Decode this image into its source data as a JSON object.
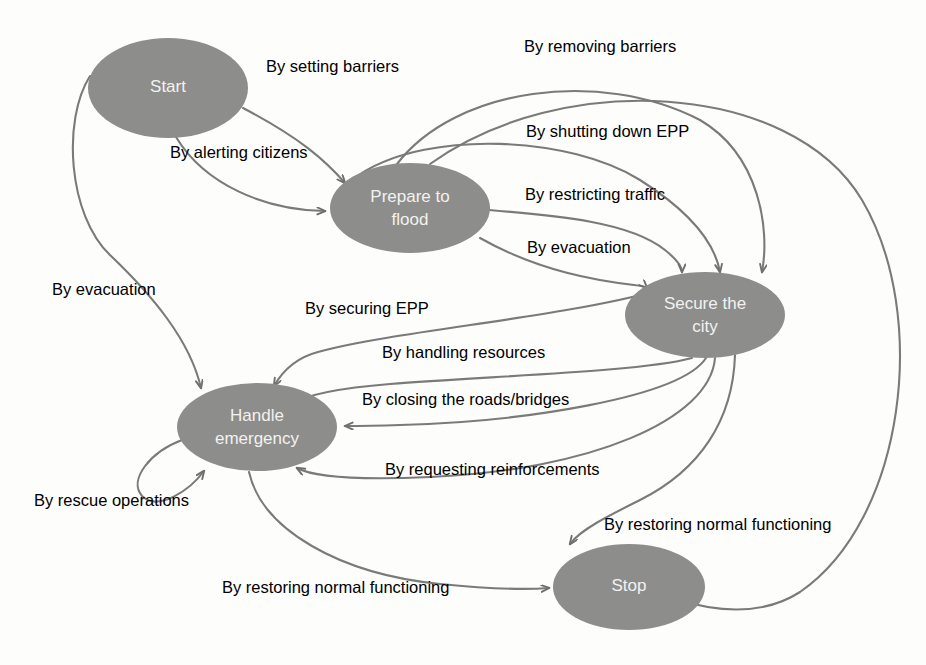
{
  "diagram": {
    "type": "state-machine",
    "colors": {
      "node_fill": "#8d8d8b",
      "node_text": "#f2f2f0",
      "edge_stroke": "#7a7a78",
      "label_text": "#2b2b2b",
      "background": "#fdfdfc"
    },
    "nodes": [
      {
        "id": "start",
        "label": "Start",
        "label_line1": "Start",
        "label_line2": "",
        "cx": 168,
        "cy": 88,
        "rx": 80,
        "ry": 50
      },
      {
        "id": "prepare",
        "label": "Prepare to flood",
        "label_line1": "Prepare to",
        "label_line2": "flood",
        "cx": 410,
        "cy": 208,
        "rx": 80,
        "ry": 45
      },
      {
        "id": "secure",
        "label": "Secure the city",
        "label_line1": "Secure the",
        "label_line2": "city",
        "cx": 705,
        "cy": 315,
        "rx": 80,
        "ry": 43
      },
      {
        "id": "handle",
        "label": "Handle emergency",
        "label_line1": "Handle",
        "label_line2": "emergency",
        "cx": 257,
        "cy": 427,
        "rx": 80,
        "ry": 44
      },
      {
        "id": "stop",
        "label": "Stop",
        "label_line1": "Stop",
        "label_line2": "",
        "cx": 629,
        "cy": 587,
        "rx": 76,
        "ry": 43
      }
    ],
    "edges": [
      {
        "id": "e1",
        "from": "start",
        "to": "prepare",
        "label": "By setting barriers",
        "label_x": 266,
        "label_y": 57
      },
      {
        "id": "e2",
        "from": "start",
        "to": "prepare",
        "label": "By alerting citizens",
        "label_x": 170,
        "label_y": 143
      },
      {
        "id": "e3",
        "from": "start",
        "to": "handle",
        "label": "By evacuation",
        "label_x": 52,
        "label_y": 280
      },
      {
        "id": "e4",
        "from": "prepare",
        "to": "secure",
        "label": "By removing barriers",
        "label_x": 524,
        "label_y": 37
      },
      {
        "id": "e5",
        "from": "prepare",
        "to": "secure",
        "label": "By shutting down EPP",
        "label_x": 526,
        "label_y": 122
      },
      {
        "id": "e6",
        "from": "prepare",
        "to": "secure",
        "label": "By restricting traffic",
        "label_x": 525,
        "label_y": 185
      },
      {
        "id": "e7",
        "from": "prepare",
        "to": "secure",
        "label": "By evacuation",
        "label_x": 527,
        "label_y": 238
      },
      {
        "id": "e8",
        "from": "secure",
        "to": "handle",
        "label": "By securing EPP",
        "label_x": 305,
        "label_y": 299
      },
      {
        "id": "e9",
        "from": "secure",
        "to": "handle",
        "label": "By handling resources",
        "label_x": 382,
        "label_y": 343
      },
      {
        "id": "e10",
        "from": "secure",
        "to": "handle",
        "label": "By closing the roads/bridges",
        "label_x": 362,
        "label_y": 390
      },
      {
        "id": "e11",
        "from": "secure",
        "to": "handle",
        "label": "By requesting reinforcements",
        "label_x": 385,
        "label_y": 460
      },
      {
        "id": "e12",
        "from": "handle",
        "to": "handle",
        "label": "By rescue operations",
        "label_x": 34,
        "label_y": 491
      },
      {
        "id": "e13",
        "from": "handle",
        "to": "stop",
        "label": "By restoring normal functioning",
        "label_x": 222,
        "label_y": 578
      },
      {
        "id": "e14",
        "from": "secure",
        "to": "stop",
        "label": "By restoring normal functioning",
        "label_x": 604,
        "label_y": 515
      },
      {
        "id": "e15",
        "from": "prepare",
        "to": "stop",
        "label": "",
        "label_x": 0,
        "label_y": 0
      }
    ]
  }
}
